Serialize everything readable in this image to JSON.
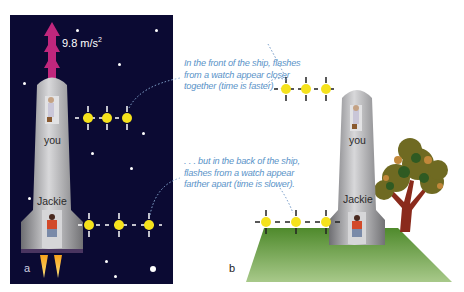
{
  "figure_a": {
    "letter": "a",
    "acceleration_label": "9.8 m/s",
    "acceleration_exponent": "2",
    "top_person_label": "you",
    "bottom_person_label": "Jackie",
    "background_color": "#0b0a33",
    "arrow_color": "#c0277d",
    "stars": [
      {
        "x": 77,
        "y": 30,
        "big": false
      },
      {
        "x": 156,
        "y": 30,
        "big": false
      },
      {
        "x": 119,
        "y": 64,
        "big": false
      },
      {
        "x": 24,
        "y": 83,
        "big": false
      },
      {
        "x": 143,
        "y": 133,
        "big": false
      },
      {
        "x": 92,
        "y": 153,
        "big": false
      },
      {
        "x": 131,
        "y": 168,
        "big": false
      },
      {
        "x": 29,
        "y": 198,
        "big": false
      },
      {
        "x": 106,
        "y": 261,
        "big": false
      },
      {
        "x": 153,
        "y": 269,
        "big": true
      },
      {
        "x": 115,
        "y": 276,
        "big": false
      }
    ],
    "top_flashes": {
      "count": 3,
      "spacing": "close"
    },
    "bottom_flashes": {
      "count": 3,
      "spacing": "far"
    }
  },
  "figure_b": {
    "letter": "b",
    "top_person_label": "you",
    "bottom_person_label": "Jackie",
    "ground_color": "#5e9a36"
  },
  "captions": {
    "top": [
      "In the front of the ship, flashes",
      "from a watch appear closer",
      "together (time is faster) . . ."
    ],
    "bottom": [
      ". . . but in the back of the ship,",
      "flashes from a watch appear",
      "farther apart (time is slower)."
    ],
    "color": "#5a93c8"
  },
  "flash_color": "#f5e21c"
}
